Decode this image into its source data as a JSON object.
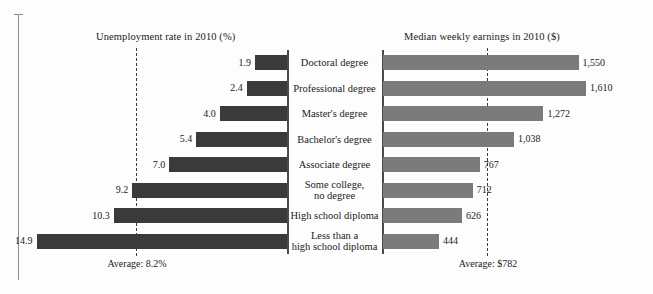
{
  "chart_data": {
    "type": "bar",
    "title": "",
    "orientation": "horizontal",
    "layout": "back-to-back bidirectional (tornado) chart",
    "categories": [
      "Doctoral degree",
      "Professional degree",
      "Master's degree",
      "Bachelor's degree",
      "Associate degree",
      "Some college,\nno degree",
      "High school diploma",
      "Less than a\nhigh school diploma"
    ],
    "series": [
      {
        "name": "Unemployment rate in 2010 (%)",
        "side": "left",
        "color": "#3a3a3a",
        "values": [
          1.9,
          2.4,
          4.0,
          5.4,
          7.0,
          9.2,
          10.3,
          14.9
        ],
        "labels": [
          "1.9",
          "2.4",
          "4.0",
          "5.4",
          "7.0",
          "9.2",
          "10.3",
          "14.9"
        ],
        "axis_max": 16.0,
        "reference_value": 8.2,
        "reference_label": "Average: 8.2%"
      },
      {
        "name": "Median weekly earnings in 2010 ($)",
        "side": "right",
        "color": "#7b7b7b",
        "values": [
          1550,
          1610,
          1272,
          1038,
          767,
          712,
          626,
          444
        ],
        "labels": [
          "1,550",
          "1,610",
          "1,272",
          "1,038",
          "767",
          "712",
          "626",
          "444"
        ],
        "axis_max": 1760,
        "reference_value": 782,
        "reference_label": "Average: $782"
      }
    ],
    "xlabel": "",
    "ylabel": "",
    "grid": false,
    "legend": "none"
  },
  "panels": {
    "left": {
      "title": "Unemployment rate in 2010 (%)",
      "average_label": "Average: 8.2%"
    },
    "right": {
      "title": "Median weekly earnings in 2010 ($)",
      "average_label": "Average: $782"
    }
  },
  "rows": [
    {
      "category": "Doctoral degree",
      "category_line2": "",
      "left_value": "1.9",
      "right_value": "1,550"
    },
    {
      "category": "Professional degree",
      "category_line2": "",
      "left_value": "2.4",
      "right_value": "1,610"
    },
    {
      "category": "Master's degree",
      "category_line2": "",
      "left_value": "4.0",
      "right_value": "1,272"
    },
    {
      "category": "Bachelor's degree",
      "category_line2": "",
      "left_value": "5.4",
      "right_value": "1,038"
    },
    {
      "category": "Associate degree",
      "category_line2": "",
      "left_value": "7.0",
      "right_value": "767"
    },
    {
      "category": "Some college,",
      "category_line2": "no degree",
      "left_value": "9.2",
      "right_value": "712"
    },
    {
      "category": "High school diploma",
      "category_line2": "",
      "left_value": "10.3",
      "right_value": "626"
    },
    {
      "category": "Less than a",
      "category_line2": "high school diploma",
      "left_value": "14.9",
      "right_value": "444"
    }
  ],
  "colors": {
    "left_bar": "#3a3a3a",
    "right_bar": "#7b7b7b",
    "axis": "#4a4a4a",
    "dashed_reference": "#3c3c3c",
    "background": "#fdfdfd"
  }
}
